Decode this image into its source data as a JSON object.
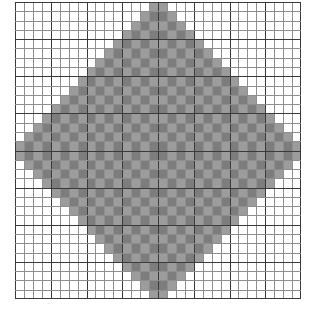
{
  "figure": {
    "background_color": "#ffffff",
    "width": 317,
    "height": 315
  },
  "plot": {
    "left": 15,
    "top": 2,
    "width": 286,
    "height": 297,
    "background_color": "#ffffff"
  },
  "grid": {
    "minor_color": "#8e8e8e",
    "major_color": "#3a3a3a",
    "minor_width": 1,
    "major_width": 1,
    "major_every": 4,
    "visible": true
  },
  "annotations": {
    "corner_mark": "'"
  },
  "chart_data": {
    "type": "heatmap",
    "title": "",
    "subtitle": "",
    "xlabel": "",
    "ylabel": "",
    "xlim": [
      0,
      32
    ],
    "ylim": [
      0,
      32
    ],
    "grid": true,
    "legend": null,
    "legend_position": "none",
    "n_cols": 32,
    "n_rows": 32,
    "center_col": 15.5,
    "center_row": 15.5,
    "radius": 16,
    "colors": {
      "outside": "#ffffff",
      "band_dark": "#7d7d7d",
      "band_light": "#9c9c9c"
    },
    "value_scheme": {
      "outside": 0,
      "band_dark": 1,
      "band_light": 2
    },
    "xtick_labels": [],
    "ytick_labels": [],
    "colorbar": false
  }
}
